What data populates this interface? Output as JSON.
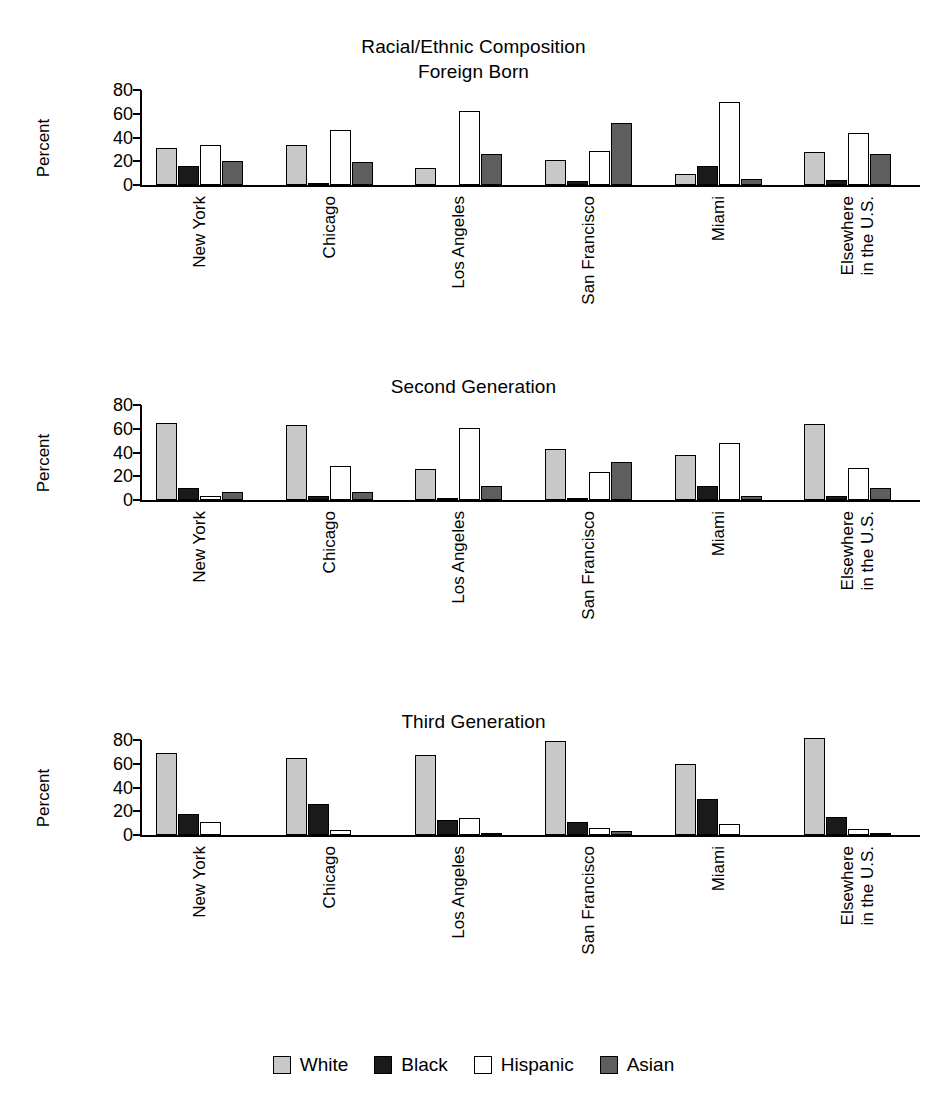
{
  "figure": {
    "main_title": "Racial/Ethnic Composition",
    "ylabel": "Percent",
    "yticks": [
      "0",
      "20",
      "40",
      "60",
      "80"
    ],
    "legend": [
      {
        "label": "White",
        "key": "white",
        "color": "#c8c8c8"
      },
      {
        "label": "Black",
        "key": "black",
        "color": "#1a1a1a"
      },
      {
        "label": "Hispanic",
        "key": "hispanic",
        "color": "#ffffff"
      },
      {
        "label": "Asian",
        "key": "asian",
        "color": "#5e5e5e"
      }
    ]
  },
  "chart_data": [
    {
      "type": "bar",
      "title": "Racial/Ethnic Composition",
      "subtitle": "Foreign Born",
      "xlabel": "",
      "ylabel": "Percent",
      "ylim": [
        0,
        80
      ],
      "yticks": [
        0,
        20,
        40,
        60,
        80
      ],
      "grid": false,
      "legend_position": "bottom",
      "categories": [
        "New York",
        "Chicago",
        "Los Angeles",
        "San Francisco",
        "Miami",
        "Elsewhere in the U.S."
      ],
      "series": [
        {
          "name": "White",
          "values": [
            31,
            34,
            14,
            21,
            9,
            28
          ]
        },
        {
          "name": "Black",
          "values": [
            16,
            2,
            0,
            3,
            16,
            4
          ]
        },
        {
          "name": "Hispanic",
          "values": [
            34,
            46,
            62,
            29,
            70,
            44
          ]
        },
        {
          "name": "Asian",
          "values": [
            20,
            19,
            26,
            52,
            5,
            26
          ]
        }
      ]
    },
    {
      "type": "bar",
      "title": "Second Generation",
      "subtitle": "",
      "xlabel": "",
      "ylabel": "Percent",
      "ylim": [
        0,
        80
      ],
      "yticks": [
        0,
        20,
        40,
        60,
        80
      ],
      "grid": false,
      "legend_position": "bottom",
      "categories": [
        "New York",
        "Chicago",
        "Los Angeles",
        "San Francisco",
        "Miami",
        "Elsewhere in the U.S."
      ],
      "series": [
        {
          "name": "White",
          "values": [
            65,
            63,
            26,
            43,
            38,
            64
          ]
        },
        {
          "name": "Black",
          "values": [
            10,
            3,
            1,
            1,
            12,
            3
          ]
        },
        {
          "name": "Hispanic",
          "values": [
            3,
            29,
            61,
            24,
            48,
            27
          ]
        },
        {
          "name": "Asian",
          "values": [
            7,
            7,
            12,
            32,
            3,
            10
          ]
        }
      ]
    },
    {
      "type": "bar",
      "title": "Third Generation",
      "subtitle": "",
      "xlabel": "",
      "ylabel": "Percent",
      "ylim": [
        0,
        80
      ],
      "yticks": [
        0,
        20,
        40,
        60,
        80
      ],
      "grid": false,
      "legend_position": "bottom",
      "categories": [
        "New York",
        "Chicago",
        "Los Angeles",
        "San Francisco",
        "Miami",
        "Elsewhere in the U.S."
      ],
      "series": [
        {
          "name": "White",
          "values": [
            69,
            65,
            67,
            79,
            60,
            82
          ]
        },
        {
          "name": "Black",
          "values": [
            18,
            26,
            13,
            11,
            30,
            15
          ]
        },
        {
          "name": "Hispanic",
          "values": [
            11,
            4,
            14,
            6,
            9,
            5
          ]
        },
        {
          "name": "Asian",
          "values": [
            0,
            0,
            2,
            3,
            0,
            1
          ]
        }
      ]
    }
  ],
  "panels": [
    {
      "title_lines": [
        "Racial/Ethnic Composition",
        "Foreign Born"
      ]
    },
    {
      "title_lines": [
        "Second Generation"
      ]
    },
    {
      "title_lines": [
        "Third Generation"
      ]
    }
  ]
}
